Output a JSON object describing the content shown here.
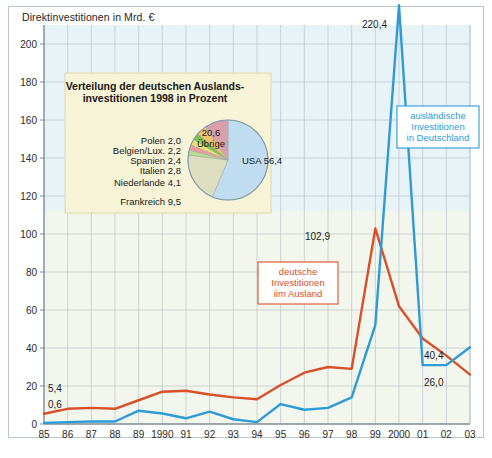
{
  "page": {
    "title": "Direktinvestitionen in Mrd. €",
    "background": "#ffffff",
    "frame_border": "#b9c6cc"
  },
  "colors": {
    "blue": "#2e9bd6",
    "red": "#d8502a",
    "plot_bg": "#f3f6ec",
    "plot_bg_upper": "#e8f3f7",
    "grid": "#b7c4cb",
    "axis": "#7d8d95",
    "pie_bg": "#f6f3d7",
    "pie_border": "#ddd7a8"
  },
  "chart_data": {
    "type": "line",
    "title": "Direktinvestitionen in Mrd. €",
    "xlabel": "",
    "ylabel": "Mrd. €",
    "ylim": [
      0,
      210
    ],
    "yticks": [
      0,
      20,
      40,
      60,
      80,
      100,
      120,
      140,
      160,
      180,
      200
    ],
    "grid": true,
    "legend_position": "inline-boxes",
    "categories": [
      "85",
      "86",
      "87",
      "88",
      "89",
      "1990",
      "91",
      "92",
      "93",
      "94",
      "95",
      "96",
      "97",
      "98",
      "99",
      "2000",
      "01",
      "02",
      "03"
    ],
    "series": [
      {
        "name": "deutsche Investitionen im Ausland",
        "color": "#d8502a",
        "values": [
          5.4,
          8.0,
          8.5,
          8.0,
          12.5,
          17.0,
          17.5,
          15.5,
          14.0,
          13.0,
          20.5,
          27.0,
          30.0,
          29.0,
          102.9,
          62.0,
          45.0,
          36.0,
          26.0
        ]
      },
      {
        "name": "ausländische Investitionen in Deutschland",
        "color": "#2e9bd6",
        "values": [
          0.6,
          1.0,
          1.3,
          1.3,
          7.0,
          5.5,
          3.0,
          6.5,
          2.5,
          1.0,
          10.5,
          7.5,
          8.5,
          14.0,
          52.0,
          220.4,
          31.0,
          31.0,
          40.4
        ]
      }
    ],
    "point_labels": [
      {
        "text": "5,4",
        "series": "deutsche Investitionen im Ausland",
        "category": "85"
      },
      {
        "text": "0,6",
        "series": "ausländische Investitionen in Deutschland",
        "category": "85"
      },
      {
        "text": "102,9",
        "series": "deutsche Investitionen im Ausland",
        "category": "99"
      },
      {
        "text": "220,4",
        "series": "ausländische Investitionen in Deutschland",
        "category": "2000"
      },
      {
        "text": "40,4",
        "series": "ausländische Investitionen in Deutschland",
        "category": "03"
      },
      {
        "text": "26,0",
        "series": "deutsche Investitionen im Ausland",
        "category": "03"
      }
    ]
  },
  "legend_blue": {
    "line1": "ausländische",
    "line2": "Investitionen",
    "line3": "in Deutschland"
  },
  "legend_red": {
    "line1": "deutsche",
    "line2": "Investitionen",
    "line3": "iim Ausland"
  },
  "pie_chart": {
    "type": "pie",
    "title_line1": "Verteilung der deutschen Auslands-",
    "title_line2": "investitionen 1998 in Prozent",
    "unit": "Prozent",
    "slices": [
      {
        "label": "USA",
        "value": 56.4,
        "label_text": "USA 56,4",
        "color": "#bfdcf0"
      },
      {
        "label": "Übrige",
        "value": 20.6,
        "label_text": "20,6",
        "label_text2": "Übrige",
        "color": "#ddddc0"
      },
      {
        "label": "Polen",
        "value": 2.0,
        "label_text": "Polen 2,0",
        "color": "#b9dc8e"
      },
      {
        "label": "Belgien/Lux.",
        "value": 2.2,
        "label_text": "Belgien/Lux. 2,2",
        "color": "#f09aa0"
      },
      {
        "label": "Spanien",
        "value": 2.4,
        "label_text": "Spanien 2,4",
        "color": "#ece36a"
      },
      {
        "label": "Italien",
        "value": 2.8,
        "label_text": "Italien 2,8",
        "color": "#7ec24a"
      },
      {
        "label": "Niederlande",
        "value": 4.1,
        "label_text": "Niederlande 4,1",
        "color": "#f5c06a"
      },
      {
        "label": "Frankreich",
        "value": 9.5,
        "label_text": "Frankreich 9,5",
        "color": "#d9a0ac"
      }
    ]
  }
}
